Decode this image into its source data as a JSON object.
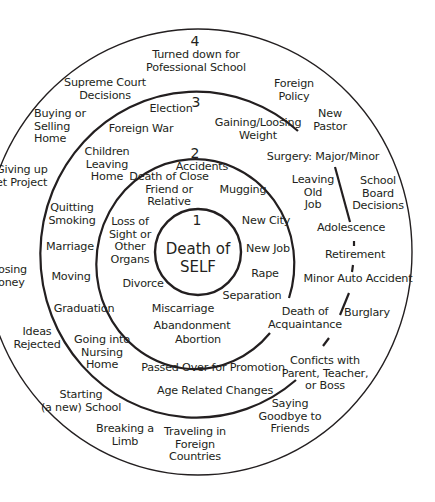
{
  "diagram": {
    "type": "concentric-circles",
    "colors": {
      "line": "#231f20",
      "background": "#ffffff",
      "text": "#231f20"
    },
    "rings": [
      {
        "number": "1",
        "center_label": "Death of\nSELF",
        "items": []
      },
      {
        "number": "2",
        "items": [
          "Accidents",
          "Death of Close\nFriend or\nRelative",
          "Mugging",
          "Loss of\nSight or\nOther\nOrgans",
          "New City",
          "New Job",
          "Rape",
          "Divorce",
          "Separation",
          "Miscarriage",
          "Abandonment",
          "Abortion"
        ]
      },
      {
        "number": "3",
        "items": [
          "Election",
          "Foreign War",
          "Gaining/Loosing\nWeight",
          "Children\nLeaving\nHome",
          "Surgery: Major/Minor",
          "Leaving\nOld\nJob",
          "Quitting\nSmoking",
          "Marriage",
          "Adolescence",
          "Retirement",
          "Moving",
          "Minor Auto Accident",
          "Graduation",
          "Death of\nAcquaintance",
          "Going into\nNursing\nHome",
          "Passed Over for Promotion",
          "Age Related Changes"
        ]
      },
      {
        "number": "4",
        "items": [
          "Turned down for\nPofessional School",
          "Supreme Court\nDecisions",
          "Foreign\nPolicy",
          "Buying or\nSelling\nHome",
          "New\nPastor",
          "Giving up\net Project",
          "School\nBoard\nDecisions",
          "osing\noney",
          "Burglary",
          "Ideas\nRejected",
          "Conficts with\nParent, Teacher,\nor Boss",
          "Starting\n(a new) School",
          "Saying\nGoodbye to\nFriends",
          "Breaking a\nLimb",
          "Traveling in\nForeign\nCountries"
        ]
      }
    ]
  }
}
